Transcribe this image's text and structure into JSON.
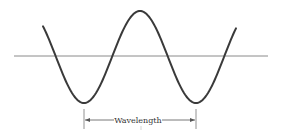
{
  "diagram": {
    "title": "",
    "wave": {
      "type": "sine",
      "amplitude_px": 46,
      "wavelength_px": 112,
      "baseline_y": 57,
      "start_x": 43,
      "end_x": 236,
      "stroke_color": "#3a3a3a"
    },
    "axis": {
      "x1": 14,
      "x2": 268,
      "y": 56,
      "color": "#7a7a7a"
    },
    "annotation": {
      "label": "Wavelength",
      "x_start": 84,
      "x_end": 196,
      "y": 120,
      "color": "#555555"
    }
  }
}
